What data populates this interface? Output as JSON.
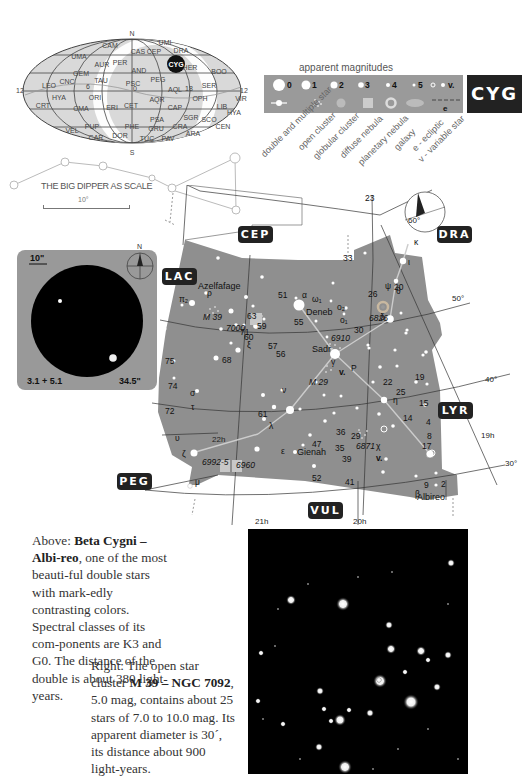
{
  "constellation_code": "CYG",
  "all_sky_map": {
    "poles": {
      "north": "N",
      "south": "S"
    },
    "ra_labels": {
      "left": "12",
      "mid_left": "6",
      "center": "0",
      "mid_right": "18",
      "right": "12"
    },
    "highlight": "CYG",
    "constellations": [
      "CAM",
      "CAS",
      "CEP",
      "UMI",
      "DRA",
      "UMA",
      "AUR",
      "PER",
      "AND",
      "HER",
      "BOO",
      "GEM",
      "TAU",
      "PEG",
      "LEO",
      "CNC",
      "PSC",
      "AQL",
      "SER",
      "HYA",
      "ORI",
      "AQR",
      "OPH",
      "VIR",
      "CRT",
      "CMA",
      "ERI",
      "CET",
      "CAP",
      "LIB",
      "HYA",
      "PSA",
      "SGR",
      "SCO",
      "VEL",
      "PUP",
      "PHE",
      "GRU",
      "CRA",
      "CEN",
      "CAR",
      "DOR",
      "TUC",
      "PAV",
      "ARA"
    ]
  },
  "legend": {
    "title": "apparent magnitudes",
    "magnitudes": [
      "0",
      "1",
      "2",
      "3",
      "4",
      "5",
      "v."
    ],
    "ecliptic_symbol": "e",
    "symbol_labels": [
      "double and multiple star",
      "open cluster",
      "globular cluster",
      "diffuse nebula",
      "planetary nebula",
      "galaxy",
      "e - ecliptic",
      "v - variable star"
    ]
  },
  "scale": {
    "title": "THE BIG DIPPER AS SCALE",
    "bar_label": "10°"
  },
  "eyepiece": {
    "scale_label": "10\"",
    "north": "N",
    "magnitudes": "3.1 + 5.1",
    "separation": "34.5\""
  },
  "star_chart": {
    "neighbors": {
      "cep": "CEP",
      "dra": "DRA",
      "lac": "LAC",
      "lyr": "LYR",
      "peg": "PEG",
      "vul": "VUL"
    },
    "dec_labels": {
      "d60": "60°",
      "d50": "50°",
      "d40": "40°",
      "d30": "30°"
    },
    "ra_labels": {
      "h22": "22h",
      "h21": "21h",
      "h20": "20h",
      "h19": "19h"
    },
    "named_stars": {
      "deneb": "Deneb",
      "sadr": "Sadr",
      "gienah": "Gienah",
      "albireo": "Albireo",
      "azelfafage": "Azelfafage"
    },
    "objects": {
      "m39": "M 39",
      "m29": "M 29",
      "n7000": "7000",
      "n6910": "6910",
      "n6826": "6826",
      "n6871": "6871",
      "n6992": "6992-5",
      "n6960": "6960"
    },
    "greek": {
      "alpha": "α",
      "gamma": "γ",
      "epsilon": "ε",
      "delta": "δ",
      "beta": "β",
      "zeta": "ζ",
      "eta": "η",
      "chi": "χ",
      "kappa": "κ",
      "iota": "ι",
      "theta": "θ",
      "psi": "ψ",
      "xi": "ξ",
      "nu": "ν",
      "lambda": "λ",
      "tau": "τ",
      "sigma": "σ",
      "upsilon": "υ",
      "rho": "ρ",
      "mu": "μ",
      "pi1": "π₁",
      "pi2": "π₂",
      "omega1": "ω₁",
      "o1": "ο₁",
      "o2": "ο₂",
      "psi2": "ψ",
      "P": "P",
      "v": "v."
    },
    "numbers": [
      "23",
      "33",
      "20",
      "26",
      "51",
      "63",
      "59",
      "71",
      "60",
      "55",
      "57",
      "56",
      "30",
      "75",
      "68",
      "74",
      "72",
      "61",
      "14",
      "19",
      "22",
      "25",
      "15",
      "4",
      "8",
      "17",
      "47",
      "36",
      "29",
      "35",
      "39",
      "52",
      "41",
      "9",
      "2"
    ]
  },
  "captions": {
    "albireo": {
      "prefix": "Above: ",
      "bold": "Beta Cygni – Albi-reo",
      "text": ", one of the most beauti-ful double stars with mark-edly contrasting colors. Spectral classes of its com-ponents are K3 and G0. The distance of the double is about 380 light-years."
    },
    "m39": {
      "prefix": "Right: The open star cluster ",
      "bold": "M 39 – NGC 7092",
      "text": ", 5.0 mag, contains about 25 stars of 7.0 to 10.0 mag. Its apparent diameter is 30´, its distance about 900 light-years."
    }
  }
}
